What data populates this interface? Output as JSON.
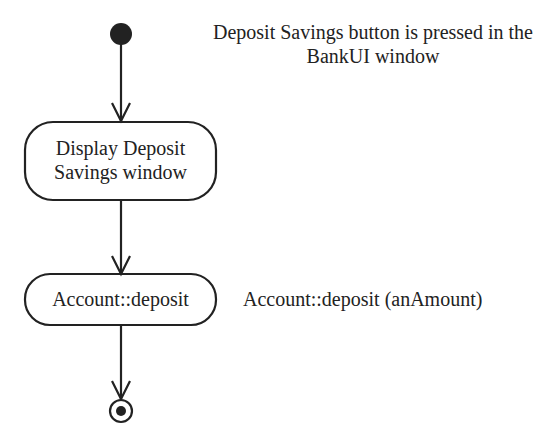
{
  "diagram": {
    "type": "UML activity diagram",
    "start_node": {
      "shape": "filled-circle"
    },
    "end_node": {
      "shape": "bullseye"
    },
    "annotations": {
      "trigger": "Deposit Savings button is pressed in the BankUI window",
      "deposit_call": "Account::deposit (anAmount)"
    },
    "activities": [
      {
        "label": "Display Deposit Savings window"
      },
      {
        "label": "Account::deposit"
      }
    ],
    "flows": [
      {
        "from": "start",
        "to": "Display Deposit Savings window"
      },
      {
        "from": "Display Deposit Savings window",
        "to": "Account::deposit"
      },
      {
        "from": "Account::deposit",
        "to": "end"
      }
    ],
    "colors": {
      "stroke": "#222222",
      "background": "#ffffff"
    }
  }
}
